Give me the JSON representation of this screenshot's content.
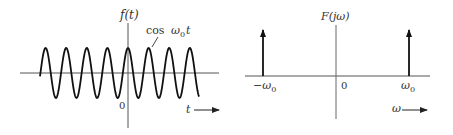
{
  "left_panel": {
    "y_axis_label": "f(t)",
    "curve_label": "cos ω₀t",
    "curve_label_parts": {
      "fn": "cos",
      "var": "ω",
      "sub": "0",
      "t": "t"
    },
    "origin_label": "0",
    "x_axis_label": "t",
    "signal": {
      "type": "cosine",
      "expression": "cos ω0 t",
      "visible_periods": 7.5
    }
  },
  "right_panel": {
    "y_axis_label": "F(jω)",
    "origin_label": "0",
    "neg_freq_label": "−ω₀",
    "neg_freq_parts": {
      "minus": "−",
      "var": "ω",
      "sub": "0"
    },
    "pos_freq_label": "ω₀",
    "pos_freq_parts": {
      "var": "ω",
      "sub": "0"
    },
    "x_axis_label": "ω",
    "impulses": [
      {
        "position": "-ω0"
      },
      {
        "position": "ω0"
      }
    ]
  },
  "colors": {
    "ink": "#1a1a1a",
    "axis": "#555555",
    "text": "#333333"
  }
}
